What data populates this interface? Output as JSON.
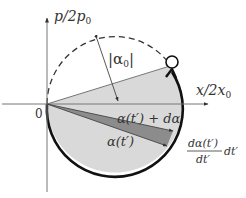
{
  "diagram": {
    "axes": {
      "y_label": "p/2p",
      "y_label_sub": "0",
      "x_label": "x/2x",
      "x_label_sub": "0",
      "origin_label": "0"
    },
    "labels": {
      "alpha0_abs": "|α",
      "alpha0_sub": "0",
      "alpha0_close": "|",
      "alpha_t_plus": "α(t′) + dα",
      "alpha_t": "α(t′)",
      "derivative_num": "dα(t′)",
      "derivative_den": "dt′",
      "derivative_suffix": "dt′"
    },
    "colors": {
      "axis": "#666666",
      "circle_solid": "#111111",
      "circle_dashed": "#333333",
      "light_fill": "#d9d9d9",
      "dark_fill": "#8c8c8c",
      "text": "#333333"
    }
  }
}
